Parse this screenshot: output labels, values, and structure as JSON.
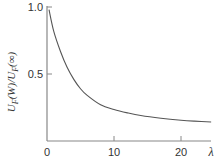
{
  "chart_data": {
    "type": "line",
    "title": "",
    "xlabel": "λ",
    "ylabel_parts": {
      "main": "U",
      "sub": "F",
      "arg1": "(W)/",
      "main2": "U",
      "sub2": "F",
      "arg2": "(∞)"
    },
    "ylabel": "U_F(W)/U_F(∞)",
    "xlim": [
      0,
      24.5
    ],
    "ylim": [
      0,
      1.0
    ],
    "xticks": [
      0,
      10,
      20
    ],
    "xtick_labels": [
      "0",
      "10",
      "20"
    ],
    "yticks": [
      0.5,
      1.0
    ],
    "ytick_labels": [
      "0.5",
      "1.0"
    ],
    "grid": false,
    "legend": "none",
    "series": [
      {
        "name": "U_F(W)/U_F(∞)",
        "color": "#555555",
        "x": [
          0.3,
          1.0,
          2.0,
          3.0,
          4.0,
          5.0,
          6.0,
          8.0,
          10.0,
          12.0,
          14.0,
          17.0,
          20.0,
          22.0,
          24.5
        ],
        "y": [
          0.98,
          0.82,
          0.67,
          0.55,
          0.46,
          0.39,
          0.34,
          0.27,
          0.235,
          0.21,
          0.19,
          0.17,
          0.155,
          0.148,
          0.142
        ]
      }
    ]
  }
}
